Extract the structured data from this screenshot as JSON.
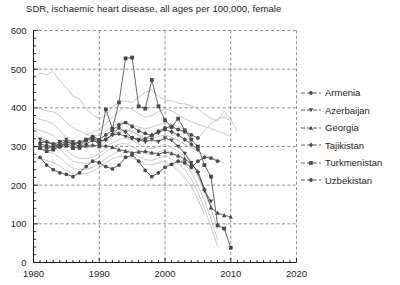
{
  "chart_data": {
    "type": "line",
    "title": "SDR, ischaemic heart disease, all ages per 100,000, female",
    "xlabel": "",
    "ylabel": "",
    "xlim": [
      1980,
      2020
    ],
    "ylim": [
      0,
      600
    ],
    "xticks": [
      1980,
      1990,
      2000,
      2010,
      2020
    ],
    "yticks": [
      0,
      100,
      200,
      300,
      400,
      500,
      600
    ],
    "grid": true,
    "minor_tick_interval_x": 1,
    "minor_tick_interval_y": 20,
    "legend_position": "right",
    "highlight_color": "#4a4a4a",
    "context_color": "#bdbdbd",
    "series": [
      {
        "name": "Armenia",
        "marker": "circle",
        "highlighted": true,
        "x": [
          1981,
          1982,
          1983,
          1984,
          1985,
          1986,
          1987,
          1988,
          1989,
          1990,
          1991,
          1992,
          1993,
          1994,
          1995,
          1996,
          1997,
          1998,
          1999,
          2000,
          2001,
          2002,
          2003,
          2004,
          2005,
          2006,
          2007,
          2008
        ],
        "values": [
          272,
          252,
          240,
          232,
          228,
          222,
          232,
          248,
          262,
          258,
          248,
          242,
          252,
          272,
          278,
          262,
          238,
          222,
          232,
          246,
          254,
          262,
          258,
          246,
          262,
          272,
          270,
          262
        ]
      },
      {
        "name": "Azerbaijan",
        "marker": "triangle-down",
        "highlighted": true,
        "x": [
          1981,
          1982,
          1983,
          1984,
          1985,
          1986,
          1987,
          1988,
          1989,
          1990,
          1991,
          1992,
          1993,
          1994,
          1995,
          1996,
          1997,
          1998,
          1999,
          2000,
          2001,
          2002,
          2003,
          2004,
          2005,
          2006,
          2007
        ],
        "values": [
          318,
          310,
          306,
          312,
          318,
          312,
          306,
          318,
          322,
          314,
          318,
          330,
          332,
          326,
          322,
          318,
          312,
          318,
          312,
          322,
          316,
          300,
          282,
          258,
          232,
          186,
          158
        ]
      },
      {
        "name": "Georgia",
        "marker": "triangle-up",
        "highlighted": true,
        "x": [
          1981,
          1982,
          1983,
          1984,
          1985,
          1986,
          1987,
          1988,
          1989,
          1990,
          1991,
          1992,
          1993,
          1994,
          1995,
          1996,
          1997,
          1998,
          1999,
          2000,
          2001,
          2002,
          2003,
          2004,
          2005,
          2006,
          2007,
          2008,
          2009,
          2010
        ],
        "values": [
          300,
          298,
          296,
          302,
          308,
          300,
          296,
          302,
          304,
          300,
          302,
          298,
          292,
          288,
          284,
          286,
          288,
          284,
          280,
          286,
          282,
          276,
          268,
          254,
          236,
          190,
          142,
          128,
          122,
          118
        ]
      },
      {
        "name": "Tajikistan",
        "marker": "diamond",
        "highlighted": true,
        "x": [
          1981,
          1982,
          1983,
          1984,
          1985,
          1986,
          1987,
          1988,
          1989,
          1990,
          1991,
          1992,
          1993,
          1994,
          1995,
          1996,
          1997,
          1998,
          1999,
          2000,
          2001,
          2002,
          2003,
          2004,
          2005
        ],
        "values": [
          310,
          312,
          306,
          300,
          312,
          308,
          300,
          306,
          316,
          312,
          318,
          332,
          348,
          338,
          322,
          316,
          320,
          330,
          336,
          344,
          338,
          330,
          318,
          306,
          292
        ]
      },
      {
        "name": "Turkmenistan",
        "marker": "square",
        "highlighted": true,
        "x": [
          1981,
          1982,
          1983,
          1984,
          1985,
          1986,
          1987,
          1988,
          1989,
          1990,
          1991,
          1992,
          1993,
          1994,
          1995,
          1996,
          1997,
          1998,
          1999,
          2000,
          2001,
          2002,
          2003,
          2004,
          2005,
          2006,
          2007,
          2008,
          2009,
          2010
        ],
        "values": [
          296,
          288,
          292,
          300,
          302,
          296,
          300,
          316,
          318,
          306,
          396,
          346,
          414,
          528,
          530,
          404,
          398,
          472,
          404,
          368,
          350,
          372,
          342,
          318,
          300,
          252,
          222,
          96,
          88,
          38
        ]
      },
      {
        "name": "Uzbekistan",
        "marker": "circle",
        "highlighted": true,
        "x": [
          1981,
          1982,
          1983,
          1984,
          1985,
          1986,
          1987,
          1988,
          1989,
          1990,
          1991,
          1992,
          1993,
          1994,
          1995,
          1996,
          1997,
          1998,
          1999,
          2000,
          2001,
          2002,
          2003,
          2004,
          2005
        ],
        "values": [
          306,
          302,
          300,
          308,
          312,
          306,
          312,
          318,
          326,
          318,
          330,
          342,
          356,
          362,
          352,
          340,
          334,
          328,
          340,
          348,
          352,
          344,
          338,
          330,
          322
        ]
      },
      {
        "name": "context-1",
        "marker": "none",
        "highlighted": false,
        "x": [
          1980,
          1981,
          1982,
          1983,
          1984,
          1985,
          1986,
          1987,
          1988,
          1989,
          1990,
          1991,
          1992,
          1993,
          1994,
          1995,
          1996,
          1997,
          1998,
          1999,
          2000,
          2001,
          2002,
          2003,
          2004,
          2005,
          2006,
          2007,
          2008,
          2009,
          2010,
          2011
        ],
        "values": [
          482,
          490,
          486,
          494,
          470,
          452,
          430,
          424,
          398,
          382,
          372,
          380,
          402,
          414,
          418,
          414,
          428,
          440,
          446,
          430,
          420,
          418,
          412,
          410,
          406,
          398,
          384,
          372,
          366,
          392,
          370,
          340
        ]
      },
      {
        "name": "context-2",
        "marker": "none",
        "highlighted": false,
        "x": [
          1980,
          1981,
          1982,
          1983,
          1984,
          1985,
          1986,
          1987,
          1988,
          1989,
          1990,
          1991,
          1992,
          1993,
          1994,
          1995,
          1996,
          1997,
          1998,
          1999,
          2000,
          2001,
          2002,
          2003,
          2004,
          2005,
          2006,
          2007,
          2008,
          2009,
          2010
        ],
        "values": [
          400,
          398,
          392,
          390,
          380,
          362,
          348,
          340,
          332,
          326,
          330,
          340,
          352,
          360,
          364,
          356,
          350,
          346,
          350,
          356,
          362,
          358,
          352,
          344,
          334,
          320,
          340,
          360,
          372,
          376,
          366
        ]
      },
      {
        "name": "context-3",
        "marker": "none",
        "highlighted": false,
        "x": [
          1980,
          1981,
          1982,
          1983,
          1984,
          1985,
          1986,
          1987,
          1988,
          1989,
          1990,
          1991,
          1992,
          1993,
          1994,
          1995,
          1996,
          1997,
          1998,
          1999,
          2000,
          2001,
          2002,
          2003,
          2004,
          2005,
          2006,
          2007,
          2008,
          2009
        ],
        "values": [
          376,
          370,
          366,
          358,
          342,
          322,
          306,
          300,
          296,
          298,
          306,
          318,
          330,
          340,
          344,
          338,
          330,
          322,
          320,
          326,
          330,
          324,
          316,
          306,
          298,
          288,
          278,
          272,
          266,
          258
        ]
      },
      {
        "name": "context-4",
        "marker": "none",
        "highlighted": false,
        "x": [
          1980,
          1981,
          1982,
          1983,
          1984,
          1985,
          1986,
          1987,
          1988,
          1989,
          1990,
          1991,
          1992,
          1993,
          1994,
          1995,
          1996,
          1997,
          1998,
          1999,
          2000,
          2001,
          2002,
          2003,
          2004,
          2005,
          2006,
          2007
        ],
        "values": [
          348,
          342,
          336,
          328,
          312,
          292,
          276,
          270,
          268,
          272,
          282,
          296,
          310,
          318,
          322,
          316,
          306,
          298,
          294,
          300,
          306,
          298,
          288,
          274,
          252,
          222,
          182,
          146
        ]
      },
      {
        "name": "context-5",
        "marker": "none",
        "highlighted": false,
        "x": [
          1980,
          1981,
          1982,
          1983,
          1984,
          1985,
          1986,
          1987,
          1988,
          1989,
          1990,
          1991,
          1992,
          1993,
          1994,
          1995,
          1996,
          1997,
          1998,
          1999,
          2000,
          2001,
          2002,
          2003,
          2004,
          2005,
          2006,
          2007,
          2008
        ],
        "values": [
          330,
          322,
          316,
          308,
          294,
          276,
          262,
          258,
          256,
          262,
          272,
          286,
          298,
          306,
          308,
          300,
          290,
          282,
          280,
          286,
          292,
          284,
          272,
          256,
          232,
          200,
          160,
          112,
          58
        ]
      },
      {
        "name": "context-6",
        "marker": "none",
        "highlighted": false,
        "x": [
          1980,
          1981,
          1982,
          1983,
          1984,
          1985,
          1986,
          1987,
          1988,
          1989,
          1990,
          1991,
          1992,
          1993,
          1994,
          1995,
          1996,
          1997,
          1998,
          1999,
          2000,
          2001,
          2002,
          2003,
          2004,
          2005,
          2006,
          2007,
          2008
        ],
        "values": [
          298,
          292,
          288,
          282,
          272,
          256,
          244,
          240,
          240,
          246,
          256,
          268,
          280,
          288,
          290,
          284,
          274,
          266,
          264,
          270,
          276,
          268,
          256,
          240,
          216,
          182,
          140,
          92,
          42
        ]
      },
      {
        "name": "context-7",
        "marker": "none",
        "highlighted": false,
        "x": [
          1980,
          1981,
          1982,
          1983,
          1984,
          1985,
          1986,
          1987,
          1988,
          1989,
          1990,
          1991,
          1992,
          1993,
          1994,
          1995,
          1996,
          1997,
          1998,
          1999,
          2000,
          2001,
          2002,
          2003,
          2004,
          2005,
          2006
        ],
        "values": [
          272,
          268,
          264,
          258,
          250,
          238,
          230,
          228,
          230,
          236,
          246,
          258,
          268,
          274,
          276,
          270,
          262,
          254,
          252,
          258,
          262,
          252,
          238,
          220,
          196,
          164,
          124
        ]
      },
      {
        "name": "context-8",
        "marker": "none",
        "highlighted": false,
        "x": [
          1988,
          1989,
          1990,
          1991,
          1992,
          1993,
          1994,
          1995,
          1996,
          1997,
          1998,
          1999,
          2000,
          2001,
          2002,
          2003,
          2004,
          2005,
          2006,
          2007,
          2008,
          2009,
          2010
        ],
        "values": [
          330,
          338,
          344,
          358,
          376,
          392,
          402,
          396,
          384,
          376,
          380,
          390,
          398,
          392,
          382,
          372,
          364,
          358,
          352,
          346,
          340,
          334,
          326
        ]
      },
      {
        "name": "context-9",
        "marker": "none",
        "highlighted": false,
        "x": [
          1990,
          1991,
          1992,
          1993,
          1994,
          1995,
          1996,
          1997,
          1998,
          1999,
          2000,
          2001,
          2002,
          2003,
          2004,
          2005,
          2006,
          2007,
          2008
        ],
        "values": [
          300,
          312,
          326,
          338,
          344,
          338,
          328,
          318,
          312,
          318,
          322,
          314,
          302,
          286,
          262,
          230,
          190,
          140,
          86
        ]
      }
    ]
  },
  "legend": {
    "items": [
      {
        "label": "Armenia",
        "marker": "circle"
      },
      {
        "label": "Azerbaijan",
        "marker": "triangle-down"
      },
      {
        "label": "Georgia",
        "marker": "triangle-up"
      },
      {
        "label": "Tajikistan",
        "marker": "diamond"
      },
      {
        "label": "Turkmenistan",
        "marker": "square"
      },
      {
        "label": "Uzbekistan",
        "marker": "circle"
      }
    ]
  }
}
